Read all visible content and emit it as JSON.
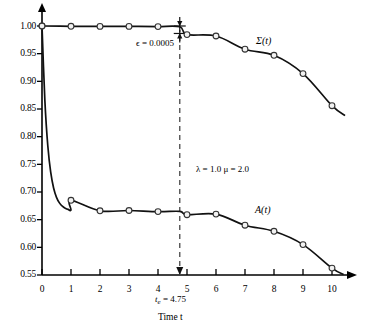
{
  "chart_data": {
    "type": "line",
    "title": "",
    "xlabel": "Time t",
    "ylabel": "",
    "xlim": [
      0,
      10.4
    ],
    "ylim": [
      0.55,
      1.005
    ],
    "grid": false,
    "legend": "inline-curve-labels",
    "xticks": [
      "0",
      "1",
      "2",
      "3",
      "4",
      "5",
      "6",
      "7",
      "8",
      "9",
      "10"
    ],
    "yticks": [
      "0.55",
      "0.60",
      "0.65",
      "0.70",
      "0.75",
      "0.80",
      "0.85",
      "0.90",
      "0.95",
      "1.00"
    ],
    "series": [
      {
        "name": "Σ(t)",
        "label": "Σ(t)",
        "marker": "circle-open",
        "x": [
          0,
          1,
          2,
          3,
          4,
          4.75,
          5,
          6,
          7,
          8,
          9,
          10
        ],
        "values": [
          1.0,
          0.9995,
          0.9993,
          0.9992,
          0.999,
          0.9985,
          0.9845,
          0.982,
          0.958,
          0.947,
          0.914,
          0.856
        ],
        "label_x": 7.6,
        "label_y": 0.978
      },
      {
        "name": "A(t)",
        "label": "A(t)",
        "marker": "circle-open",
        "x": [
          0,
          1,
          2,
          3,
          4,
          4.75,
          5,
          6,
          7,
          8,
          9,
          10
        ],
        "values": [
          1.0,
          0.685,
          0.666,
          0.6665,
          0.6645,
          0.665,
          0.659,
          0.66,
          0.64,
          0.629,
          0.605,
          0.5625
        ],
        "label_x": 7.55,
        "label_y": 0.662
      }
    ],
    "annotations": [
      {
        "name": "epsilon",
        "text": "ϵ = 0.0005",
        "x": 4.78,
        "y": 0.968
      },
      {
        "name": "parameters",
        "text": "λ = 1.0    μ = 2.0",
        "x": 5.9,
        "y": 0.716
      },
      {
        "name": "te-marker-value",
        "text_prefix": "t",
        "text_sub": "e",
        "text_suffix": " = 4.75",
        "x": 4.75
      }
    ],
    "vline": {
      "name": "te-dashed-line",
      "x": 4.75,
      "style": "dashed",
      "color": "#555555"
    },
    "epsilon_bar": {
      "x": 4.75,
      "y_top": 1.0,
      "y_bottom": 0.9865
    }
  },
  "axis_labels": {
    "x_axis_title": "Time t",
    "te_label": "t",
    "te_sub": "e",
    "te_value": " = 4.75"
  },
  "colors": {
    "curve": "#111111",
    "axis": "#000000",
    "vline": "#555555",
    "marker_fill": "#f2f2f2",
    "marker_stroke": "#333333"
  }
}
